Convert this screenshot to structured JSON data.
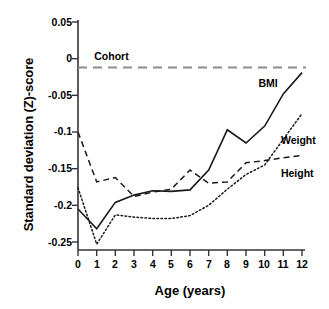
{
  "chart_data": {
    "type": "line",
    "title": "",
    "xlabel": "Age (years)",
    "ylabel": "Standard deviation (Z)-score",
    "xlim": [
      0,
      12
    ],
    "ylim": [
      -0.25,
      0.05
    ],
    "grid": false,
    "legend_position": "inline-right",
    "x_ticks": [
      "0",
      "1",
      "2",
      "3",
      "4",
      "5",
      "6",
      "7",
      "8",
      "9",
      "10",
      "11",
      "12"
    ],
    "y_ticks": [
      "0.05",
      "0",
      "-0.05",
      "-0.1",
      "-0.15",
      "-0.2",
      "-0.25"
    ],
    "x": [
      0,
      1,
      2,
      3,
      4,
      5,
      6,
      7,
      8,
      9,
      10,
      11,
      12
    ],
    "series": [
      {
        "name": "BMI",
        "style": "solid",
        "color": "#1a1a1a",
        "values": [
          -0.205,
          -0.232,
          -0.196,
          -0.186,
          -0.18,
          -0.181,
          -0.179,
          -0.152,
          -0.097,
          -0.115,
          -0.092,
          -0.048,
          -0.019
        ]
      },
      {
        "name": "Weight",
        "style": "dotted",
        "color": "#1a1a1a",
        "values": [
          -0.176,
          -0.253,
          -0.213,
          -0.216,
          -0.218,
          -0.218,
          -0.214,
          -0.2,
          -0.178,
          -0.158,
          -0.145,
          -0.11,
          -0.075
        ]
      },
      {
        "name": "Height",
        "style": "dashed",
        "color": "#1a1a1a",
        "values": [
          -0.1,
          -0.168,
          -0.162,
          -0.188,
          -0.182,
          -0.178,
          -0.152,
          -0.17,
          -0.168,
          -0.142,
          -0.139,
          -0.135,
          -0.132
        ]
      }
    ],
    "reference_line": {
      "name": "Cohort",
      "style": "long-dashed",
      "color": "#808080",
      "value": -0.012,
      "label": "Cohort",
      "label_x": 1.2
    },
    "annotations": [
      {
        "text": "BMI",
        "x": 10.1,
        "y": -0.035
      },
      {
        "text": "Weight",
        "x": 11.3,
        "y": -0.112
      },
      {
        "text": "Height",
        "x": 11.3,
        "y": -0.157
      },
      {
        "text": "Cohort",
        "x": 1.3,
        "y": 0.002
      }
    ]
  }
}
